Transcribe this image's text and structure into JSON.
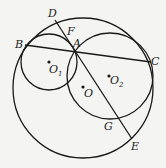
{
  "figure": {
    "circles": [
      {
        "name": "O",
        "cx": 83,
        "cy": 88,
        "r": 70
      },
      {
        "name": "O1",
        "cx": 49,
        "cy": 62,
        "r": 28
      },
      {
        "name": "O2",
        "cx": 110,
        "cy": 76,
        "r": 43
      }
    ],
    "segments": [
      {
        "name": "BC",
        "from": "B",
        "to": "C"
      },
      {
        "name": "DE",
        "from": "D",
        "to": "E"
      }
    ],
    "points": {
      "A": {
        "label": "A",
        "x": 75,
        "y": 52
      },
      "B": {
        "label": "B",
        "x": 24,
        "y": 43
      },
      "C": {
        "label": "C",
        "x": 150,
        "y": 62
      },
      "D": {
        "label": "D",
        "x": 55,
        "y": 20
      },
      "E": {
        "label": "E",
        "x": 132,
        "y": 139
      },
      "F": {
        "label": "F",
        "x": 68,
        "y": 34
      },
      "G": {
        "label": "G",
        "x": 117,
        "y": 118
      },
      "O": {
        "label": "O",
        "x": 83,
        "y": 87
      },
      "O1": {
        "label": "O",
        "sub": "1",
        "x": 49,
        "y": 62
      },
      "O2": {
        "label": "O",
        "sub": "2",
        "x": 109,
        "y": 76
      }
    }
  },
  "labels": {
    "A": "A",
    "B": "B",
    "C": "C",
    "D": "D",
    "E": "E",
    "F": "F",
    "G": "G",
    "O": "O",
    "O1_main": "O",
    "O1_sub": "1",
    "O2_main": "O",
    "O2_sub": "2"
  }
}
